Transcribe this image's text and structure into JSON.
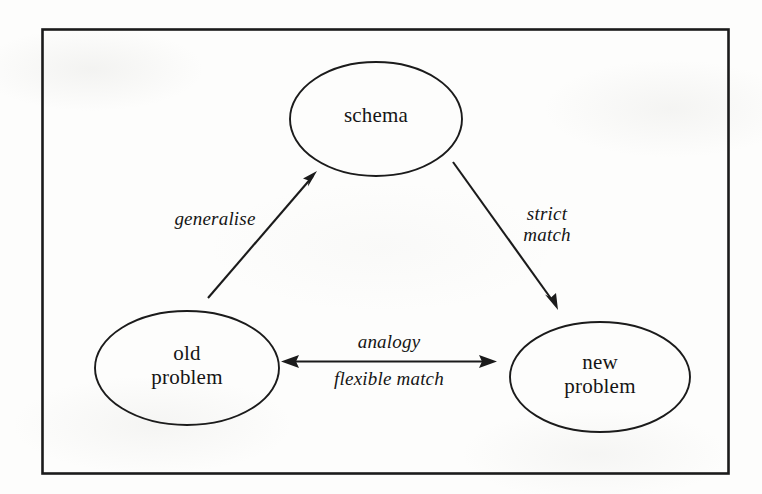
{
  "figure": {
    "type": "diagram",
    "kind": "node-and-arrow concept diagram",
    "border": {
      "color": "#1b1b1b"
    },
    "nodes": [
      {
        "id": "schema",
        "shape": "ellipse",
        "label_lines": [
          "schema"
        ],
        "style": "roman"
      },
      {
        "id": "old_problem",
        "shape": "ellipse",
        "label_lines": [
          "old",
          "problem"
        ],
        "style": "roman"
      },
      {
        "id": "new_problem",
        "shape": "ellipse",
        "label_lines": [
          "new",
          "problem"
        ],
        "style": "roman"
      }
    ],
    "edges": [
      {
        "id": "generalise",
        "from": "old_problem",
        "to": "schema",
        "arrow": "single",
        "label_lines": [
          "generalise"
        ]
      },
      {
        "id": "strict_match",
        "from": "schema",
        "to": "new_problem",
        "arrow": "single",
        "label_lines": [
          "strict",
          "match"
        ]
      },
      {
        "id": "analogy",
        "from": "old_problem",
        "to": "new_problem",
        "arrow": "double",
        "label_above_lines": [
          "analogy"
        ],
        "label_below_lines": [
          "flexible match"
        ]
      }
    ]
  },
  "labels": {
    "schema": "schema",
    "old_line1": "old",
    "old_line2": "problem",
    "new_line1": "new",
    "new_line2": "problem",
    "generalise": "generalise",
    "strict_line1": "strict",
    "strict_line2": "match",
    "analogy": "analogy",
    "flexible_match": "flexible match"
  }
}
